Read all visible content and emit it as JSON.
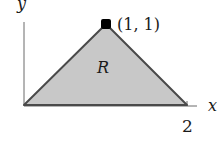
{
  "figure": {
    "type": "region-diagram",
    "labels": {
      "y_axis": "y",
      "x_axis": "x",
      "x_tick": "2",
      "apex_point": "(1, 1)",
      "region": "R"
    },
    "vertices": [
      [
        0,
        0
      ],
      [
        1,
        1
      ],
      [
        2,
        0
      ]
    ],
    "colors": {
      "fill": "#c8c8c8",
      "edge": "#4a4a4a",
      "axis": "#6a6a6a",
      "point": "#000000",
      "text": "#1a1a1a"
    }
  }
}
